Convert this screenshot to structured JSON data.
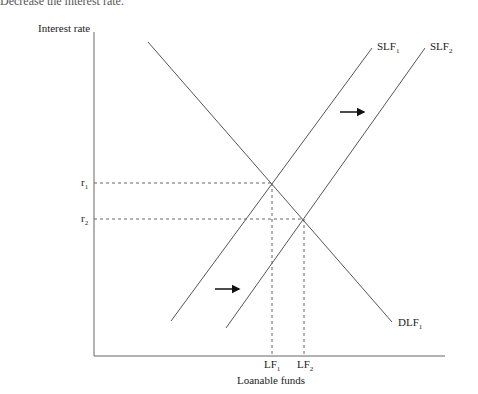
{
  "header": {
    "cut_text": "Decrease the interest rate."
  },
  "axes": {
    "y_label": "Interest rate",
    "x_label": "Loanable funds"
  },
  "curves": {
    "slf1": {
      "name": "SLF",
      "sub": "1"
    },
    "slf2": {
      "name": "SLF",
      "sub": "2"
    },
    "dlf1": {
      "name": "DLF",
      "sub": "1"
    }
  },
  "ticks": {
    "r1": {
      "name": "r",
      "sub": "1"
    },
    "r2": {
      "name": "r",
      "sub": "2"
    },
    "lf1": {
      "name": "LF",
      "sub": "1"
    },
    "lf2": {
      "name": "LF",
      "sub": "2"
    }
  },
  "colors": {
    "line": "#555555",
    "axis": "#666666",
    "arrow": "#111111"
  }
}
